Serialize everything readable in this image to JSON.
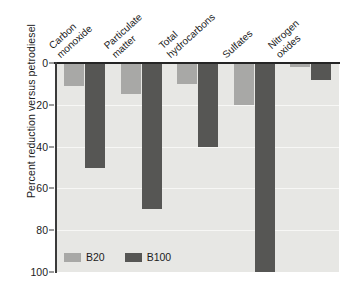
{
  "chart_data": {
    "type": "bar",
    "title": "",
    "xlabel": "",
    "ylabel": "Percent reduction versus petrodiesel",
    "ylim": [
      0,
      100
    ],
    "y_axis_inverted": true,
    "grid": true,
    "legend_position": "bottom-left",
    "categories": [
      "Carbon monoxide",
      "Particulate matter",
      "Total hydrocarbons",
      "Sulfates",
      "Nitrogen oxides"
    ],
    "category_lines": [
      [
        "Carbon",
        "monoxide"
      ],
      [
        "Particulate",
        "matter"
      ],
      [
        "Total",
        "hydrocarbons"
      ],
      [
        "Sulfates",
        ""
      ],
      [
        "Nitrogen",
        "oxides"
      ]
    ],
    "series": [
      {
        "name": "B20",
        "color": "#a8a8a6",
        "values": [
          11,
          15,
          10,
          20,
          2
        ]
      },
      {
        "name": "B100",
        "color": "#565654",
        "values": [
          50,
          70,
          40,
          100,
          8
        ]
      }
    ],
    "y_ticks": [
      "0",
      "20",
      "40",
      "60",
      "80",
      "100"
    ],
    "y_tick_values": [
      0,
      20,
      40,
      60,
      80,
      100
    ]
  },
  "legend": {
    "items": [
      {
        "label": "B20"
      },
      {
        "label": "B100"
      }
    ]
  },
  "colors": {
    "plot_background": "#e7e7e4",
    "b20": "#a8a8a6",
    "b100": "#565654",
    "axis": "#252525",
    "gridline": "#f7f7f5",
    "text": "#1c1c1c"
  }
}
